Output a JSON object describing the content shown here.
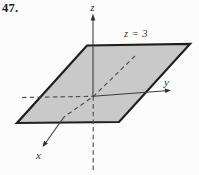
{
  "figure": {
    "problem_number": "47.",
    "plane_label": "z = 3",
    "axes": {
      "x_label": "x",
      "y_label": "y",
      "z_label": "z"
    },
    "colors": {
      "plane_fill": "#c9c9c9",
      "plane_edge": "#1e1e1e",
      "axis_line": "#3d3d3d",
      "text": "#2e2e2e",
      "background": "#fcfcfc"
    }
  }
}
